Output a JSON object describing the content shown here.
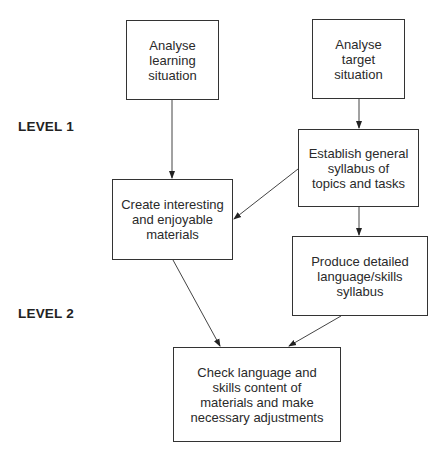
{
  "diagram": {
    "levels": [
      {
        "id": "level1",
        "label": "LEVEL 1"
      },
      {
        "id": "level2",
        "label": "LEVEL 2"
      }
    ],
    "nodes": [
      {
        "id": "analyse_learning",
        "label": "Analyse\nlearning\nsituation"
      },
      {
        "id": "analyse_target",
        "label": "Analyse\ntarget\nsituation"
      },
      {
        "id": "establish_syllabus",
        "label": "Establish general\nsyllabus of\ntopics and tasks"
      },
      {
        "id": "create_materials",
        "label": "Create interesting\nand enjoyable\nmaterials"
      },
      {
        "id": "produce_syllabus",
        "label": "Produce detailed\nlanguage/skills\nsyllabus"
      },
      {
        "id": "check_content",
        "label": "Check language and\nskills content of\nmaterials and make\nnecessary adjustments"
      }
    ],
    "edges": [
      {
        "from": "analyse_learning",
        "to": "create_materials"
      },
      {
        "from": "analyse_target",
        "to": "establish_syllabus"
      },
      {
        "from": "establish_syllabus",
        "to": "create_materials"
      },
      {
        "from": "establish_syllabus",
        "to": "produce_syllabus"
      },
      {
        "from": "create_materials",
        "to": "check_content"
      },
      {
        "from": "produce_syllabus",
        "to": "check_content"
      }
    ],
    "colors": {
      "line": "#333333",
      "text": "#222222",
      "background": "#ffffff"
    }
  }
}
